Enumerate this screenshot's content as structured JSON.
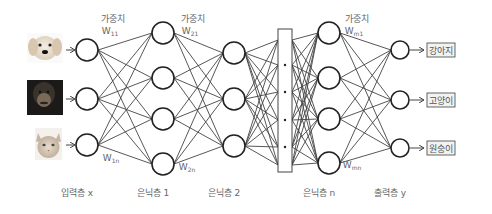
{
  "diagram": {
    "type": "neural-network",
    "inputs": [
      {
        "name": "dog-image",
        "label": "puppy photo"
      },
      {
        "name": "chimpanzee-image",
        "label": "chimpanzee photo"
      },
      {
        "name": "cat-image",
        "label": "kitten photo"
      }
    ],
    "layers": [
      {
        "id": "input",
        "label": "입력층 x",
        "x": 87,
        "nodes": [
          50,
          99,
          145
        ]
      },
      {
        "id": "hidden1",
        "label": "은닉층 1",
        "x": 163,
        "nodes": [
          33,
          78,
          119,
          164
        ]
      },
      {
        "id": "hidden2",
        "label": "은닉층 2",
        "x": 234,
        "nodes": [
          53,
          99,
          146
        ]
      },
      {
        "id": "ellipsis",
        "label": "",
        "x": 285
      },
      {
        "id": "hiddenN",
        "label": "은닉층 n",
        "x": 329,
        "nodes": [
          33,
          78,
          119,
          163
        ]
      },
      {
        "id": "output",
        "label": "출력층 y",
        "x": 400,
        "nodes": [
          50,
          100,
          148
        ]
      }
    ],
    "weight_labels": [
      {
        "title": "가중치",
        "w": "W",
        "sub": "11",
        "x": 113,
        "y": 22
      },
      {
        "title": "가중치",
        "w": "W",
        "sub": "21",
        "x": 193,
        "y": 22
      },
      {
        "title": "가중치",
        "w": "W",
        "sub": "m1",
        "x": 357,
        "y": 22
      },
      {
        "w": "W",
        "sub": "1n",
        "x": 114,
        "y": 161
      },
      {
        "w": "W",
        "sub": "2n",
        "x": 190,
        "y": 170
      },
      {
        "w": "W",
        "sub": "mn",
        "x": 355,
        "y": 168
      }
    ],
    "outputs": [
      "강아지",
      "고양이",
      "원숭이"
    ],
    "colors": {
      "line": "#444444",
      "node_stroke": "#222222",
      "text": "#666666",
      "box_fill": "#f2f2f2"
    }
  }
}
